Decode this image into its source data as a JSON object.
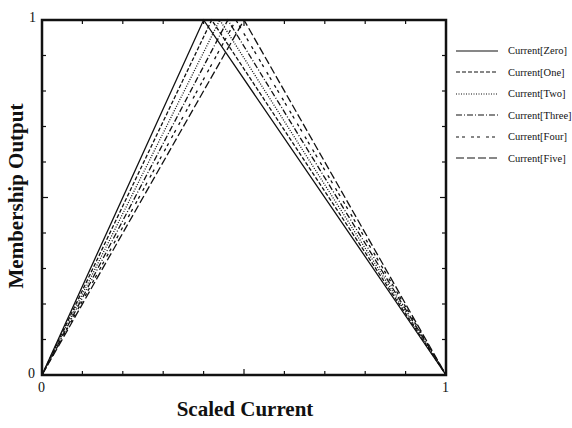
{
  "chart_data": {
    "type": "line",
    "title": "",
    "xlabel": "Scaled Current",
    "ylabel": "Membership Output",
    "xlim": [
      0,
      1
    ],
    "ylim": [
      0,
      1
    ],
    "x_tick_labels": [
      "0",
      "1"
    ],
    "y_tick_labels": [
      "0",
      "1"
    ],
    "minor_ticks": 0.1,
    "grid": false,
    "legend_position": "right-outside",
    "series": [
      {
        "name": "Current[Zero]",
        "style": "solid",
        "x": [
          0,
          0.4,
          1
        ],
        "y": [
          0,
          1,
          0
        ]
      },
      {
        "name": "Current[One]",
        "style": "dashed",
        "x": [
          0,
          0.42,
          1
        ],
        "y": [
          0,
          1,
          0
        ]
      },
      {
        "name": "Current[Two]",
        "style": "dotted",
        "x": [
          0,
          0.44,
          1
        ],
        "y": [
          0,
          1,
          0
        ]
      },
      {
        "name": "Current[Three]",
        "style": "dashdot",
        "x": [
          0,
          0.46,
          1
        ],
        "y": [
          0,
          1,
          0
        ]
      },
      {
        "name": "Current[Four]",
        "style": "dashdotdot",
        "x": [
          0,
          0.48,
          1
        ],
        "y": [
          0,
          1,
          0
        ]
      },
      {
        "name": "Current[Five]",
        "style": "longdash",
        "x": [
          0,
          0.5,
          1
        ],
        "y": [
          0,
          1,
          0
        ]
      }
    ]
  },
  "labels": {
    "x_axis": "Scaled Current",
    "y_axis": "Membership Output",
    "x_min": "0",
    "x_max": "1",
    "y_min": "0",
    "y_max": "1"
  },
  "legend": [
    {
      "label": "Current[Zero]",
      "dash": ""
    },
    {
      "label": "Current[One]",
      "dash": "4,2"
    },
    {
      "label": "Current[Two]",
      "dash": "1,1.5"
    },
    {
      "label": "Current[Three]",
      "dash": "6,2,1,2"
    },
    {
      "label": "Current[Four]",
      "dash": "3,3,3,6"
    },
    {
      "label": "Current[Five]",
      "dash": "8,3"
    }
  ]
}
